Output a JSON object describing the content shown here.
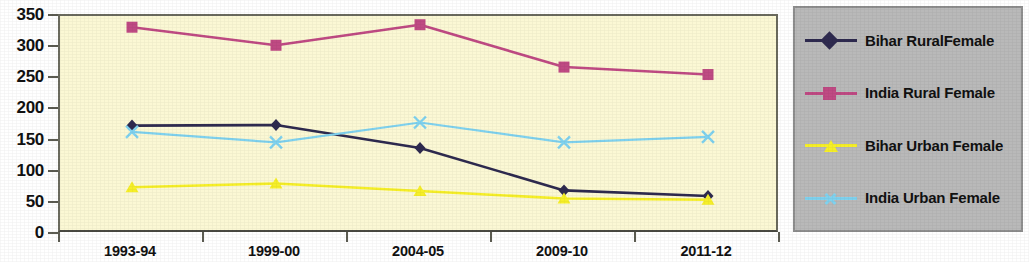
{
  "chart_data": {
    "type": "line",
    "title": "",
    "xlabel": "",
    "ylabel": "",
    "categories": [
      "1993-94",
      "1999-00",
      "2004-05",
      "2009-10",
      "2011-12"
    ],
    "ylim": [
      0,
      350
    ],
    "yticks": [
      0,
      50,
      100,
      150,
      200,
      250,
      300,
      350
    ],
    "grid": false,
    "legend_position": "right",
    "series": [
      {
        "name": "Bihar  RuralFemale",
        "color": "#2e2a4f",
        "marker": "diamond",
        "values": [
          174,
          175,
          138,
          70,
          61
        ]
      },
      {
        "name": "India  Rural  Female",
        "color": "#bf4a83",
        "marker": "square",
        "values": [
          332,
          303,
          336,
          268,
          256
        ]
      },
      {
        "name": "Bihar Urban Female",
        "color": "#f6ef28",
        "marker": "triangle",
        "values": [
          75,
          81,
          69,
          57,
          55
        ]
      },
      {
        "name": "India Urban Female",
        "color": "#7fd2ef",
        "marker": "x",
        "values": [
          164,
          147,
          179,
          147,
          156
        ]
      }
    ]
  },
  "plot": {
    "background_color": "#fbf8d4",
    "border_color": "#5c5c52"
  },
  "legend": {
    "background_color": "#b9b9b9",
    "entries": [
      {
        "label": "Bihar  RuralFemale"
      },
      {
        "label": "India  Rural  Female"
      },
      {
        "label": "Bihar Urban Female"
      },
      {
        "label": "India Urban Female"
      }
    ]
  },
  "axis": {
    "y_tick_labels": [
      "350",
      "300",
      "250",
      "200",
      "150",
      "100",
      "50",
      "0"
    ],
    "x_tick_labels": [
      "1993-94",
      "1999-00",
      "2004-05",
      "2009-10",
      "2011-12"
    ]
  }
}
